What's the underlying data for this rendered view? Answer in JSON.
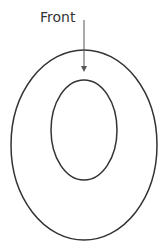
{
  "diagram": {
    "label": "Front",
    "stroke_color": "#333333",
    "outer_ellipse": {
      "cx": 84,
      "cy": 145,
      "rx": 73,
      "ry": 95
    },
    "inner_ellipse": {
      "cx": 84,
      "cy": 130,
      "rx": 33,
      "ry": 50
    },
    "arrow": {
      "x": 84,
      "y1": 20,
      "y2": 72
    }
  }
}
